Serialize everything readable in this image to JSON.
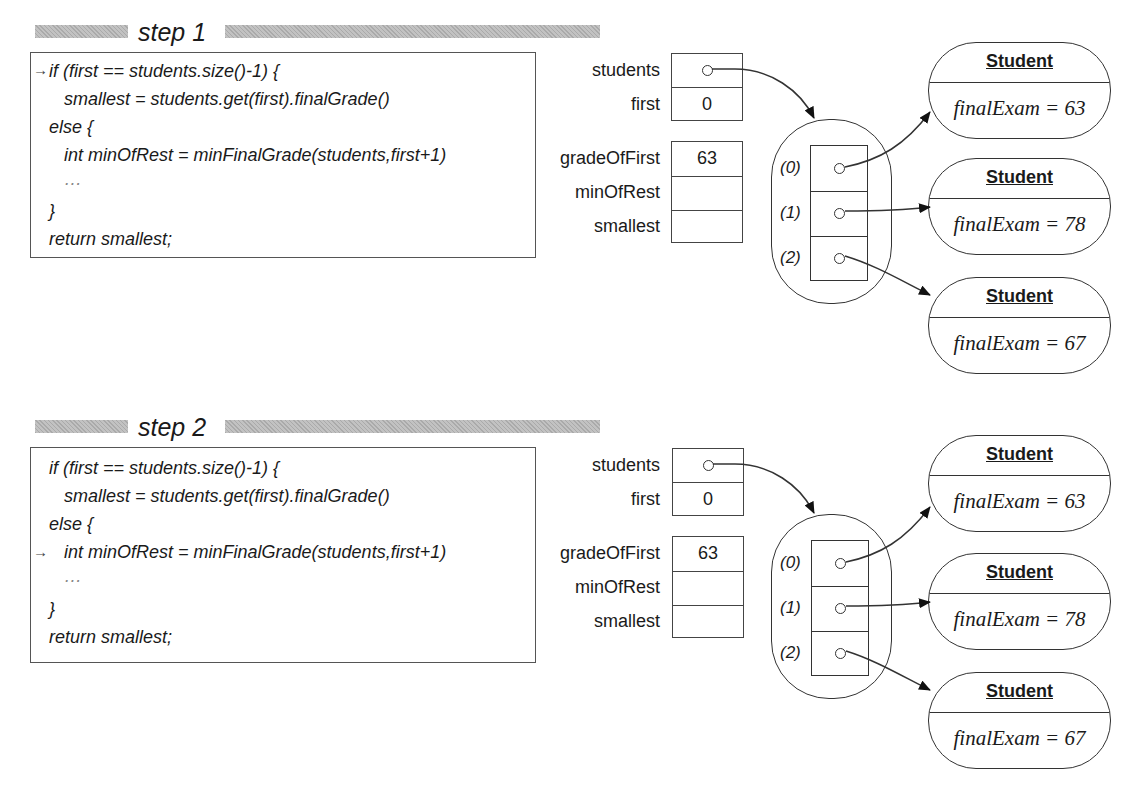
{
  "steps": [
    {
      "label": "step 1",
      "current_line_index": 0,
      "code_lines": [
        "if (first == students.size()-1) {",
        "   smallest = students.get(first).finalGrade()",
        "else {",
        "   int minOfRest = minFinalGrade(students,first+1)",
        "   …",
        "}",
        "return smallest;"
      ],
      "pc_marker": "→",
      "params": [
        {
          "name": "students",
          "value": "",
          "is_reference": true
        },
        {
          "name": "first",
          "value": "0",
          "is_reference": false
        }
      ],
      "locals": [
        {
          "name": "gradeOfFirst",
          "value": "63"
        },
        {
          "name": "minOfRest",
          "value": ""
        },
        {
          "name": "smallest",
          "value": ""
        }
      ],
      "array_indices": [
        "(0)",
        "(1)",
        "(2)"
      ],
      "objects": [
        {
          "class_name": "Student",
          "field": "finalExam = 63"
        },
        {
          "class_name": "Student",
          "field": "finalExam = 78"
        },
        {
          "class_name": "Student",
          "field": "finalExam = 67"
        }
      ]
    },
    {
      "label": "step 2",
      "current_line_index": 3,
      "code_lines": [
        "if (first == students.size()-1) {",
        "   smallest = students.get(first).finalGrade()",
        "else {",
        "   int minOfRest = minFinalGrade(students,first+1)",
        "   …",
        "}",
        "return smallest;"
      ],
      "pc_marker": "→",
      "params": [
        {
          "name": "students",
          "value": "",
          "is_reference": true
        },
        {
          "name": "first",
          "value": "0",
          "is_reference": false
        }
      ],
      "locals": [
        {
          "name": "gradeOfFirst",
          "value": "63"
        },
        {
          "name": "minOfRest",
          "value": ""
        },
        {
          "name": "smallest",
          "value": ""
        }
      ],
      "array_indices": [
        "(0)",
        "(1)",
        "(2)"
      ],
      "objects": [
        {
          "class_name": "Student",
          "field": "finalExam = 63"
        },
        {
          "class_name": "Student",
          "field": "finalExam = 78"
        },
        {
          "class_name": "Student",
          "field": "finalExam = 67"
        }
      ]
    }
  ],
  "colors": {
    "header_bar": "#b4b4b4",
    "line": "#333333",
    "text": "#1a1a1a"
  }
}
